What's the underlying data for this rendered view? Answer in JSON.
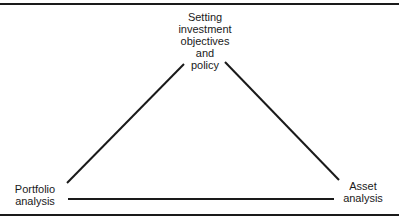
{
  "diagram": {
    "type": "triangle-cycle",
    "nodes": [
      {
        "id": "objectives",
        "position": "top",
        "lines": [
          "Setting",
          "investment",
          "objectives",
          "and",
          "policy"
        ]
      },
      {
        "id": "portfolio",
        "position": "bottom-left",
        "lines": [
          "Portfolio",
          "analysis"
        ]
      },
      {
        "id": "asset",
        "position": "bottom-right",
        "lines": [
          "Asset",
          "analysis"
        ]
      }
    ],
    "edges": [
      {
        "from": "objectives",
        "to": "portfolio"
      },
      {
        "from": "objectives",
        "to": "asset"
      },
      {
        "from": "portfolio",
        "to": "asset"
      }
    ],
    "colors": {
      "line": "#1a1a1a",
      "background": "#ffffff"
    }
  }
}
